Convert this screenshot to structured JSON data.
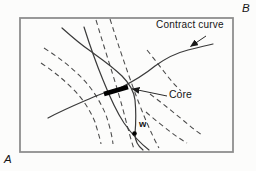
{
  "figure": {
    "labels": {
      "contract_curve": "Contract curve",
      "core": "Core",
      "endowment": "w",
      "origin_a": "A",
      "origin_b": "B"
    },
    "colors": {
      "background": "#fcfcfb",
      "box_border": "#8e8e8e",
      "curve_ink": "#3a3a3a",
      "core_segment": "#000000",
      "text": "#161616"
    }
  }
}
